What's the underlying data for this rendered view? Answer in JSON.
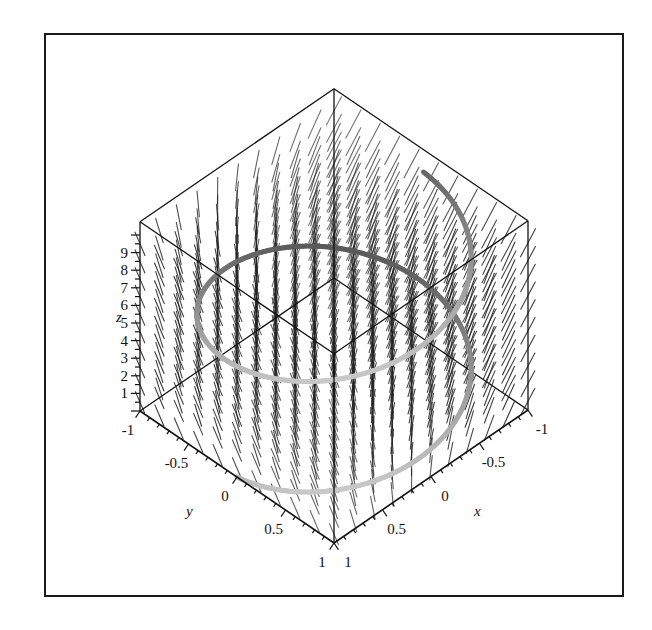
{
  "chart_data": {
    "type": "3d-vector-field-with-space-curve",
    "title": "",
    "axes": {
      "x": {
        "label": "x",
        "range": [
          -1,
          1
        ],
        "ticks": [
          -1,
          -0.5,
          0,
          0.5,
          1
        ],
        "tick_labels": [
          "-1",
          "-0.5",
          "0",
          "0.5",
          "1"
        ]
      },
      "y": {
        "label": "y",
        "range": [
          -1,
          1
        ],
        "ticks": [
          -1,
          -0.5,
          0,
          0.5,
          1
        ],
        "tick_labels": [
          "-1",
          "-0.5",
          "0",
          "0.5",
          "1"
        ]
      },
      "z": {
        "label": "z",
        "range": [
          0,
          10
        ],
        "ticks": [
          1,
          2,
          3,
          4,
          5,
          6,
          7,
          8,
          9
        ],
        "tick_labels": [
          "1",
          "2",
          "3",
          "4",
          "5",
          "6",
          "7",
          "8",
          "9"
        ]
      }
    },
    "box": {
      "style": "framed",
      "zmax": 10.75
    },
    "vector_field": {
      "description": "Field of short line segments on a grid, mostly vertical near the center, tilting toward the right side",
      "grid_x": [
        -1,
        -0.8,
        -0.6,
        -0.4,
        -0.2,
        0,
        0.2,
        0.4,
        0.6,
        0.8,
        1
      ],
      "grid_y": [
        -1,
        -0.8,
        -0.6,
        -0.4,
        -0.2,
        0,
        0.2,
        0.4,
        0.6,
        0.8,
        1
      ],
      "grid_z": [
        0.5,
        1.5,
        2.5,
        3.5,
        4.5,
        5.5,
        6.5,
        7.5,
        8.5,
        9.5
      ],
      "color": "#222222"
    },
    "curve": {
      "type": "helix",
      "param": "t",
      "x": "cos(t)",
      "y": "sin(t)",
      "z": "t",
      "t_range": [
        0,
        9.5
      ],
      "colors": {
        "near": "#c4c4c4",
        "far": "#5a5a5a"
      },
      "width": 5
    },
    "grid": false,
    "legend": null
  },
  "labels": {
    "x_axis": "x",
    "y_axis": "y",
    "z_axis": "z"
  },
  "colors": {
    "frame": "#1a1a1a",
    "box_edges": "#111111",
    "background": "#ffffff"
  }
}
